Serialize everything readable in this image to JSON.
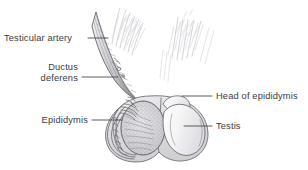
{
  "figure": {
    "background_color": "#ffffff",
    "width": 308,
    "height": 170,
    "line_color": "#6e6e72",
    "text_color": "#3a3a3c",
    "leader_color": "#4a4a4c"
  },
  "labels": {
    "testicular_artery": "Testicular artery",
    "ductus_deferens_line1": "Ductus",
    "ductus_deferens_line2": "deferens",
    "epididymis": "Epididymis",
    "head_of_epididymis": "Head of epididymis",
    "testis": "Testis"
  },
  "structures": {
    "spermatic_cord": "spermatic-cord",
    "sectioned_testis": "sectioned-testis",
    "intact_testis": "intact-testis",
    "epididymis_coil": "epididymis-coil",
    "scrotum": "scrotum",
    "pubic_hair": "pubic-hair"
  }
}
